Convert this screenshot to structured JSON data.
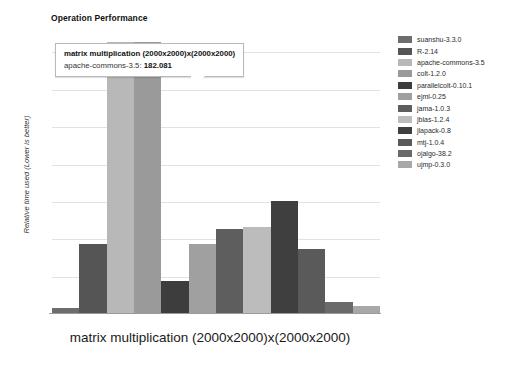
{
  "chart_data": {
    "type": "bar",
    "title": "Operation Performance",
    "xlabel": "matrix multiplication (2000x2000)x(2000x2000)",
    "ylabel": "Relative time used (Lower is better)",
    "categories": [
      "suanshu-3.3.0",
      "R-2.14",
      "apache-commons-3.5",
      "colt-1.2.0",
      "parallelcolt-0.10.1",
      "ejml-0.25",
      "jama-1.0.3",
      "jblas-1.2.4",
      "jlapack-0.8",
      "mtj-1.0.4",
      "ojalgo-38.2",
      "ujmp-0.3.0"
    ],
    "values": [
      3.6,
      46.5,
      182.081,
      182.081,
      21.5,
      46.0,
      56.5,
      57.5,
      75.5,
      43.0,
      7.5,
      4.5
    ],
    "colors": [
      "#6d6d6d",
      "#555555",
      "#b8b8b8",
      "#9a9a9a",
      "#3d3d3d",
      "#a0a0a0",
      "#5e5e5e",
      "#bcbcbc",
      "#3f3f3f",
      "#5a5a5a",
      "#6a6a6a",
      "#a8a8a8"
    ],
    "ylim": [
      0,
      190
    ],
    "grid": true,
    "gridlines": [
      25,
      50,
      75,
      100,
      125,
      150,
      175
    ],
    "legend_position": "right",
    "annotation": {
      "series": "matrix multiplication (2000x2000)x(2000x2000)",
      "label": "apache-commons-3.5:",
      "value": "182.081"
    }
  },
  "legend": {
    "items": [
      {
        "label": "suanshu-3.3.0",
        "color": "#6d6d6d"
      },
      {
        "label": "R-2.14",
        "color": "#555555"
      },
      {
        "label": "apache-commons-3.5",
        "color": "#b8b8b8"
      },
      {
        "label": "colt-1.2.0",
        "color": "#9a9a9a"
      },
      {
        "label": "parallelcolt-0.10.1",
        "color": "#3d3d3d"
      },
      {
        "label": "ejml-0.25",
        "color": "#a0a0a0"
      },
      {
        "label": "jama-1.0.3",
        "color": "#5e5e5e"
      },
      {
        "label": "jblas-1.2.4",
        "color": "#bcbcbc"
      },
      {
        "label": "jlapack-0.8",
        "color": "#3f3f3f"
      },
      {
        "label": "mtj-1.0.4",
        "color": "#5a5a5a"
      },
      {
        "label": "ojalgo-38.2",
        "color": "#6a6a6a"
      },
      {
        "label": "ujmp-0.3.0",
        "color": "#a8a8a8"
      }
    ]
  },
  "tooltip": {
    "line1": "matrix multiplication (2000x2000)x(2000x2000)",
    "label": "apache-commons-3.5:",
    "value": "182.081"
  }
}
